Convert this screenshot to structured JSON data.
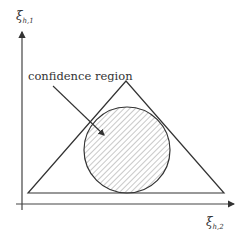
{
  "diagram": {
    "y_axis_label": {
      "main": "ξ",
      "sub": "h,1"
    },
    "x_axis_label": {
      "main": "ξ",
      "sub": "h,2"
    },
    "annotation": "confidence region",
    "colors": {
      "stroke": "#333333",
      "hatch": "#888888",
      "background": "#ffffff"
    }
  }
}
